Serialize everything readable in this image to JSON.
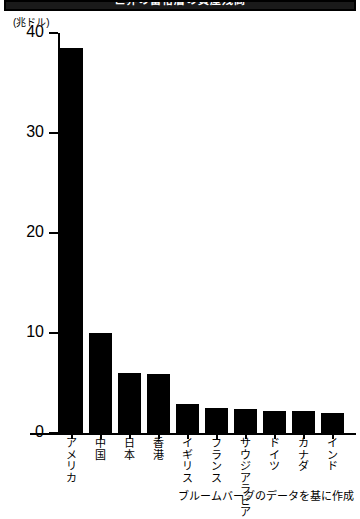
{
  "banner": {
    "title": "世界の富裕層の資産残高"
  },
  "chart_data": {
    "type": "bar",
    "title": "世界の富裕層の資産残高",
    "unit_label": "(兆ドル)",
    "xlabel": "",
    "ylabel": "",
    "ylim": [
      0,
      40
    ],
    "yticks": [
      0,
      10,
      20,
      30,
      40
    ],
    "grid": false,
    "legend": null,
    "categories": [
      "アメリカ",
      "中国",
      "日本",
      "香港",
      "イギリス",
      "フランス",
      "サウジアラビア",
      "ドイツ",
      "カナダ",
      "インド"
    ],
    "values": [
      38.5,
      10.0,
      6.0,
      5.9,
      2.9,
      2.5,
      2.4,
      2.2,
      2.2,
      2.0
    ],
    "source": "ブルームバーグのデータを基に作成",
    "bar_color": "#000000"
  }
}
